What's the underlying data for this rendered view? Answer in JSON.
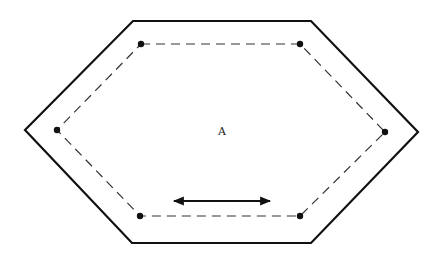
{
  "diagram": {
    "center_label": "A",
    "outer_hexagon": [
      [
        133,
        21
      ],
      [
        311,
        21
      ],
      [
        418,
        132
      ],
      [
        311,
        243
      ],
      [
        132,
        243
      ],
      [
        25,
        130
      ]
    ],
    "inner_dashed_hexagon": [
      [
        141,
        44
      ],
      [
        300,
        44
      ],
      [
        385,
        132
      ],
      [
        300,
        216
      ],
      [
        140,
        216
      ],
      [
        57,
        130
      ]
    ],
    "arrow": {
      "x1": 172,
      "y1": 201,
      "x2": 272,
      "y2": 201,
      "type": "double-headed"
    },
    "colors": {
      "stroke": "#111111",
      "dashed": "#333333",
      "background": "#ffffff"
    }
  }
}
